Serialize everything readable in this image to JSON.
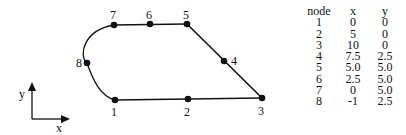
{
  "diagram": {
    "axis": {
      "x_label": "x",
      "y_label": "y"
    },
    "nodes": [
      {
        "id": "1",
        "label": "1",
        "px": 115,
        "py": 100
      },
      {
        "id": "2",
        "label": "2",
        "px": 188,
        "py": 99
      },
      {
        "id": "3",
        "label": "3",
        "px": 262,
        "py": 98
      },
      {
        "id": "4",
        "label": "4",
        "px": 224,
        "py": 61
      },
      {
        "id": "5",
        "label": "5",
        "px": 187,
        "py": 24
      },
      {
        "id": "6",
        "label": "6",
        "px": 150,
        "py": 24
      },
      {
        "id": "7",
        "label": "7",
        "px": 114,
        "py": 25
      },
      {
        "id": "8",
        "label": "8",
        "px": 87,
        "py": 63
      }
    ],
    "edges": [
      "1-2",
      "2-3",
      "3-4",
      "4-5",
      "5-6",
      "6-7",
      "7-8 (arc)",
      "8-1 (arc)"
    ]
  },
  "table": {
    "headers": [
      "node",
      "x",
      "y"
    ],
    "rows": [
      [
        "1",
        "0",
        "0"
      ],
      [
        "2",
        "5",
        "0"
      ],
      [
        "3",
        "10",
        "0"
      ],
      [
        "4",
        "7.5",
        "2.5"
      ],
      [
        "5",
        "5.0",
        "5.0"
      ],
      [
        "6",
        "2.5",
        "5.0"
      ],
      [
        "7",
        "0",
        "5.0"
      ],
      [
        "8",
        "-1",
        "2.5"
      ]
    ]
  }
}
